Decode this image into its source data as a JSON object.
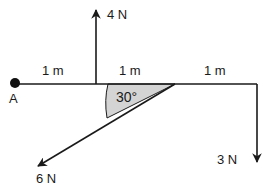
{
  "diagram": {
    "point_label": "A",
    "segments": [
      {
        "label": "1 m"
      },
      {
        "label": "1 m"
      },
      {
        "label": "1 m"
      }
    ],
    "angle_label": "30°",
    "forces": [
      {
        "label": "4 N",
        "direction": "up"
      },
      {
        "label": "6 N",
        "direction": "down-left"
      },
      {
        "label": "3 N",
        "direction": "down"
      }
    ],
    "colors": {
      "line": "#1a1a1a",
      "angle_fill": "#d4d4d4"
    }
  }
}
